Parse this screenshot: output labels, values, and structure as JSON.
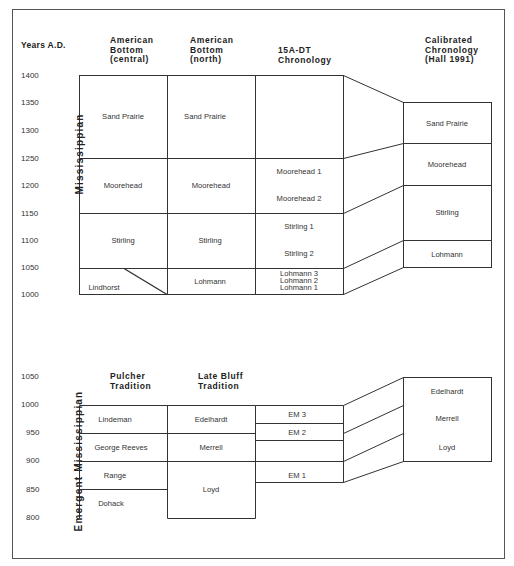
{
  "axis_title": "Years  A.D.",
  "upper": {
    "ticks": [
      "1400",
      "1350",
      "1300",
      "1250",
      "1200",
      "1150",
      "1100",
      "1050",
      "1000"
    ],
    "period_label": "Mississippian",
    "headers": {
      "col1": "American\nBottom\n(central)",
      "col2": "American\nBottom\n(north)",
      "col3": "15A-DT\nChronology",
      "col4": "Calibrated\nChronology\n(Hall  1991)"
    },
    "col1": [
      "Sand Prairie",
      "Moorehead",
      "Stirling",
      "Lindhorst"
    ],
    "col2": [
      "Sand Prairie",
      "Moorehead",
      "Stirling",
      "Lohmann"
    ],
    "col3": [
      "Moorehead 1",
      "Moorehead 2",
      "Stirling 1",
      "Stirling 2",
      "Lohmann 3",
      "Lohmann 2",
      "Lohmann 1"
    ],
    "col4": [
      "Sand Prairie",
      "Moorehead",
      "Stirling",
      "Lohmann"
    ]
  },
  "lower": {
    "ticks": [
      "1050",
      "1000",
      "950",
      "900",
      "850",
      "800"
    ],
    "period_label": "Emergent  Mississippian",
    "headers": {
      "col1": "Pulcher\nTradition",
      "col2": "Late  Bluff\nTradition"
    },
    "col1": [
      "Lindeman",
      "George Reeves",
      "Range",
      "Dohack"
    ],
    "col2": [
      "Edelhardt",
      "Merrell",
      "Loyd"
    ],
    "col3": [
      "EM 3",
      "EM 2",
      "EM 1"
    ],
    "col4": [
      "Edelhardt",
      "Merrell",
      "Loyd"
    ]
  }
}
